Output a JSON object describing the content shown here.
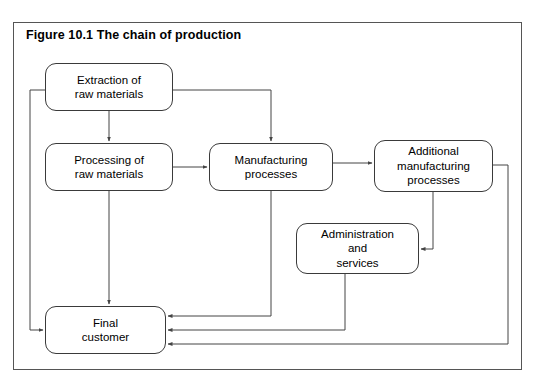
{
  "figure": {
    "title": "Figure 10.1   The chain of production",
    "border_color": "#555555",
    "node_border_color": "#3a3a3a",
    "connector_color": "#444444",
    "background": "#ffffff"
  },
  "nodes": [
    {
      "id": "extraction",
      "label": "Extraction of\nraw materials"
    },
    {
      "id": "processing",
      "label": "Processing of\nraw materials"
    },
    {
      "id": "manufacturing",
      "label": "Manufacturing\nprocesses"
    },
    {
      "id": "additional",
      "label": "Additional\nmanufacturing\nprocesses"
    },
    {
      "id": "administration",
      "label": "Administration\nand\nservices"
    },
    {
      "id": "final",
      "label": "Final\ncustomer"
    }
  ],
  "connections": [
    {
      "from": "extraction",
      "to": "processing",
      "arrow": true
    },
    {
      "from": "extraction",
      "to": "manufacturing",
      "arrow": true
    },
    {
      "from": "extraction",
      "to": "final",
      "arrow": true
    },
    {
      "from": "processing",
      "to": "manufacturing",
      "arrow": true
    },
    {
      "from": "processing",
      "to": "final",
      "arrow": true
    },
    {
      "from": "manufacturing",
      "to": "additional",
      "arrow": true
    },
    {
      "from": "manufacturing",
      "to": "final",
      "arrow": true
    },
    {
      "from": "additional",
      "to": "administration",
      "arrow": true
    },
    {
      "from": "additional",
      "to": "final",
      "arrow": true
    },
    {
      "from": "administration",
      "to": "final",
      "arrow": true
    }
  ]
}
